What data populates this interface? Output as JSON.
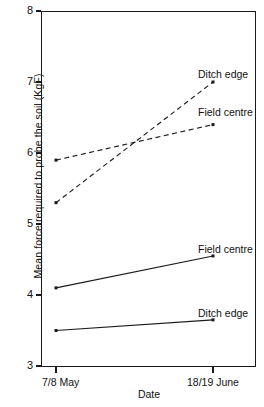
{
  "chart_data": {
    "type": "line",
    "title": "",
    "xlabel": "Date",
    "ylabel": "Mean force required to probe the soil (KgF)",
    "categories": [
      "7/8 May",
      "18/19 June"
    ],
    "x_tick_labels": [
      "7/8 May",
      "18/19 June"
    ],
    "y_tick_labels": [
      "3",
      "4",
      "5",
      "6",
      "7",
      "8"
    ],
    "y_tick_values": [
      3,
      4,
      5,
      6,
      7,
      8
    ],
    "ylim": [
      3,
      8
    ],
    "grid": false,
    "legend_position": "inline-right-of-series",
    "series": [
      {
        "name": "Ditch edge",
        "style": "dashed",
        "annotation": "Ditch edge",
        "values": [
          5.3,
          7.0
        ]
      },
      {
        "name": "Field centre",
        "style": "dashed",
        "annotation": "Field centre",
        "values": [
          5.9,
          6.4
        ]
      },
      {
        "name": "Field centre",
        "style": "solid",
        "annotation": "Field centre",
        "values": [
          4.1,
          4.55
        ]
      },
      {
        "name": "Ditch edge",
        "style": "solid",
        "annotation": "Ditch edge",
        "values": [
          3.5,
          3.65
        ]
      }
    ]
  },
  "axes": {
    "y_label": "Mean force required to probe the soil (KgF)",
    "x_label": "Date",
    "y_ticks": [
      {
        "label": "8"
      },
      {
        "label": "7"
      },
      {
        "label": "6"
      },
      {
        "label": "5"
      },
      {
        "label": "4"
      },
      {
        "label": "3"
      }
    ],
    "x_ticks": [
      {
        "label": "7/8 May"
      },
      {
        "label": "18/19 June"
      }
    ]
  },
  "annotations": {
    "dashed_ditch_edge": "Ditch edge",
    "dashed_field_centre": "Field centre",
    "solid_field_centre": "Field centre",
    "solid_ditch_edge": "Ditch edge"
  },
  "colors": {
    "ink": "#1a1a1a",
    "background": "#ffffff"
  }
}
